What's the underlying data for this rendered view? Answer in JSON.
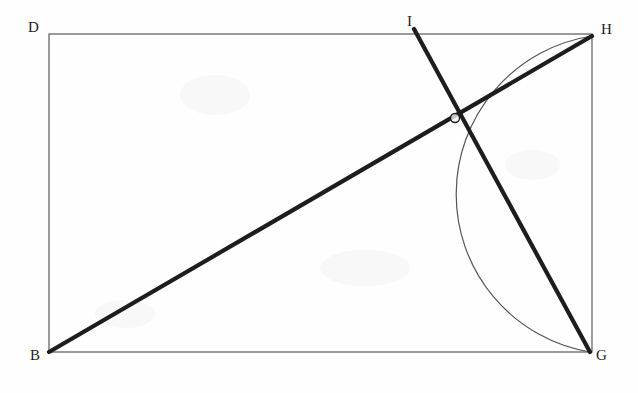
{
  "figure": {
    "background_color": "#fefefe",
    "stroke_color": "#1d1d1d",
    "thin_stroke_color": "#4a4a4a",
    "thin_width": 1.1,
    "thick_width": 4.2,
    "arc_width": 1.2,
    "rectangle": {
      "name": "rectangle-BDHG",
      "corners": [
        {
          "id": "D",
          "x": 49,
          "y": 34
        },
        {
          "id": "H",
          "x": 592,
          "y": 36
        },
        {
          "id": "G",
          "x": 590,
          "y": 352
        },
        {
          "id": "B",
          "x": 49,
          "y": 352
        }
      ]
    },
    "segments": [
      {
        "name": "diagonal-BH",
        "from": "B",
        "to": "H",
        "x1": 49,
        "y1": 352,
        "x2": 592,
        "y2": 36,
        "weight": "thick"
      },
      {
        "name": "line-IG",
        "from": "I",
        "to": "G",
        "x1": 414,
        "y1": 29,
        "x2": 590,
        "y2": 352,
        "weight": "thick"
      }
    ],
    "arc": {
      "name": "arc-HG",
      "from": "H",
      "to": "G",
      "start_x": 592,
      "start_y": 36,
      "end_x": 590,
      "end_y": 352,
      "radius_x": 160,
      "radius_y": 160,
      "sweep": 0,
      "large_arc": 0,
      "leftmost_x": 437,
      "leftmost_y": 220
    },
    "intersection_point": {
      "name": "intersection-A",
      "x": 455,
      "y": 118,
      "marked": true,
      "marker_radius": 4.5
    },
    "labels": [
      {
        "id": "D",
        "text": "D",
        "x": 28,
        "y": 20
      },
      {
        "id": "I",
        "text": "I",
        "x": 407,
        "y": 14
      },
      {
        "id": "H",
        "text": "H",
        "x": 601,
        "y": 22
      },
      {
        "id": "B",
        "text": "B",
        "x": 30,
        "y": 348
      },
      {
        "id": "G",
        "text": "G",
        "x": 596,
        "y": 348
      }
    ]
  }
}
